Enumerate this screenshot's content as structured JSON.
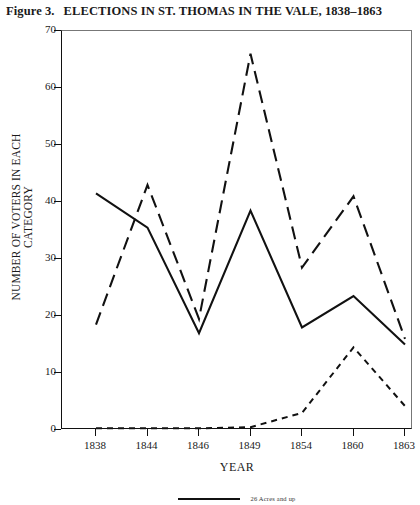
{
  "figure": {
    "number_label": "Figure 3.",
    "title": "ELECTIONS IN ST. THOMAS IN THE VALE, 1838–1863"
  },
  "axis": {
    "x_title": "YEAR",
    "y_title": "NUMBER OF VOTERS IN EACH CATEGORY"
  },
  "legend": {
    "items": [
      {
        "label": "26 Acres and up",
        "style": "solid"
      }
    ]
  },
  "chart_data": {
    "type": "line",
    "title": "ELECTIONS IN ST. THOMAS IN THE VALE, 1838–1863",
    "xlabel": "YEAR",
    "ylabel": "NUMBER OF VOTERS IN EACH CATEGORY",
    "categories": [
      "1838",
      "1844",
      "1846",
      "1849",
      "1854",
      "1860",
      "1863"
    ],
    "ylim": [
      0,
      70
    ],
    "yticks": [
      0,
      10,
      20,
      30,
      40,
      50,
      60,
      70
    ],
    "grid": false,
    "legend_position": "bottom",
    "series": [
      {
        "name": "26 Acres and up",
        "style": "solid",
        "values": [
          41.5,
          35.5,
          17.0,
          38.5,
          18.0,
          23.5,
          15.0
        ]
      },
      {
        "name": "series-dashed",
        "style": "dashed",
        "values": [
          18.5,
          43.0,
          19.5,
          66.0,
          28.5,
          41.0,
          16.0
        ]
      },
      {
        "name": "series-dotted",
        "style": "dotted",
        "values": [
          0.3,
          0.3,
          0.3,
          0.5,
          3.0,
          14.5,
          4.2
        ]
      }
    ]
  }
}
